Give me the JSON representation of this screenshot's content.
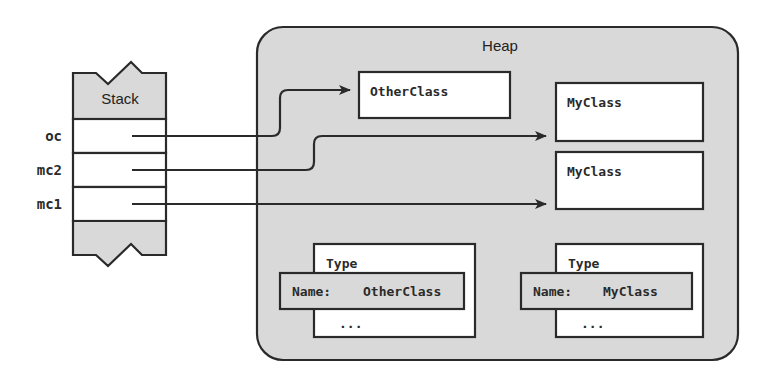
{
  "diagram": {
    "type": "memory-layout",
    "colors": {
      "stroke": "#2a2a2a",
      "fill_gray": "#d9d9d9",
      "fill_white": "#ffffff",
      "text": "#222222"
    },
    "stack": {
      "label": "Stack",
      "variables": [
        {
          "name": "oc",
          "points_to": "heap_object_otherclass"
        },
        {
          "name": "mc2",
          "points_to": "heap_object_myclass_1"
        },
        {
          "name": "mc1",
          "points_to": "heap_object_myclass_2"
        }
      ]
    },
    "heap": {
      "label": "Heap",
      "objects": [
        {
          "id": "heap_object_otherclass",
          "label": "OtherClass"
        },
        {
          "id": "heap_object_myclass_1",
          "label": "MyClass"
        },
        {
          "id": "heap_object_myclass_2",
          "label": "MyClass"
        }
      ],
      "type_objects": [
        {
          "title": "Type",
          "name_key": "Name:",
          "name_value": "OtherClass",
          "ellipsis": "..."
        },
        {
          "title": "Type",
          "name_key": "Name:",
          "name_value": "MyClass",
          "ellipsis": "..."
        }
      ]
    }
  }
}
